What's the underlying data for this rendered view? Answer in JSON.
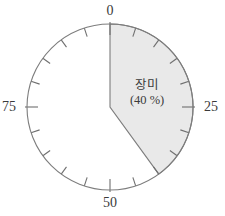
{
  "chart_data": {
    "type": "pie",
    "title": "",
    "subtitle": "",
    "xlabel": "",
    "ylabel": "",
    "grid": false,
    "legend_position": "inside-slice",
    "scale": {
      "min": 0,
      "max": 100,
      "unit": "%",
      "start_angle_deg": 0,
      "direction": "clockwise",
      "major_tick_labels": [
        "0",
        "25",
        "50",
        "75"
      ],
      "major_tick_values": [
        0,
        25,
        50,
        75
      ],
      "minor_tick_interval": 5,
      "total_ticks": 20
    },
    "slices": [
      {
        "name": "장미",
        "label": "장미",
        "value_label": "(40 %)",
        "value": 40,
        "start": 0,
        "end": 40,
        "fill": "#e9e9e9",
        "stroke": "#7d7d7d",
        "shaded": true
      },
      {
        "name": "remainder",
        "label": "",
        "value_label": "",
        "value": 60,
        "start": 40,
        "end": 100,
        "fill": "#ffffff",
        "stroke": "#7d7d7d",
        "shaded": false
      }
    ],
    "categories": [
      "장미",
      "remainder"
    ],
    "values": [
      40,
      60
    ]
  },
  "geometry": {
    "center_x": 110,
    "center_y": 107,
    "radius": 83,
    "tick_length": 9,
    "label_offset": 14
  },
  "colors": {
    "outline": "#7d7d7d",
    "slice_fill": "#e9e9e9",
    "tick": "#6f6f6f",
    "text": "#3a3a3a",
    "background": "#ffffff"
  },
  "axis_labels": {
    "top": "0",
    "right": "25",
    "bottom": "50",
    "left": "75"
  },
  "slice_annotation": {
    "name_line": "장미",
    "percent_line": "(40 %)"
  }
}
